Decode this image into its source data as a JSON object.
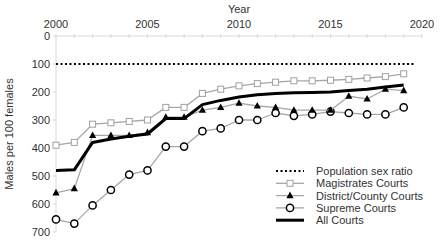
{
  "chart_data": {
    "type": "line",
    "title": "",
    "xlabel": "Year",
    "ylabel": "Males per 100 females",
    "xlim": [
      2000,
      2020
    ],
    "ylim": [
      0,
      700
    ],
    "y_inverted": true,
    "x_axis_position": "top",
    "x_ticks": [
      "2000",
      "2005",
      "2010",
      "2015",
      "2020"
    ],
    "y_ticks": [
      "0",
      "100",
      "200",
      "300",
      "400",
      "500",
      "600",
      "700"
    ],
    "grid": false,
    "legend_position": "lower right",
    "x": [
      2000,
      2001,
      2002,
      2003,
      2004,
      2005,
      2006,
      2007,
      2008,
      2009,
      2010,
      2011,
      2012,
      2013,
      2014,
      2015,
      2016,
      2017,
      2018,
      2019
    ],
    "series": [
      {
        "name": "Population sex ratio",
        "style": "dotted",
        "color": "#000000",
        "values": [
          100,
          100,
          100,
          100,
          100,
          100,
          100,
          100,
          100,
          100,
          100,
          100,
          100,
          100,
          100,
          100,
          100,
          100,
          100,
          100
        ]
      },
      {
        "name": "Magistrates Courts",
        "style": "line-open-square",
        "color": "#a6a6a6",
        "values": [
          390,
          380,
          315,
          310,
          305,
          300,
          255,
          255,
          205,
          190,
          178,
          170,
          165,
          160,
          160,
          158,
          155,
          150,
          145,
          135
        ]
      },
      {
        "name": "District/County Courts",
        "style": "line-filled-triangle",
        "color": "#a6a6a6",
        "values": [
          560,
          545,
          355,
          355,
          355,
          345,
          290,
          290,
          265,
          255,
          240,
          250,
          255,
          265,
          265,
          265,
          215,
          225,
          190,
          195
        ]
      },
      {
        "name": "Supreme Courts",
        "style": "line-open-circle",
        "color": "#a6a6a6",
        "values": [
          655,
          670,
          605,
          550,
          495,
          480,
          395,
          395,
          340,
          330,
          300,
          300,
          275,
          285,
          280,
          270,
          275,
          280,
          280,
          255
        ]
      },
      {
        "name": "All Courts",
        "style": "thick-line",
        "color": "#000000",
        "values": [
          480,
          478,
          380,
          368,
          358,
          350,
          295,
          295,
          245,
          230,
          218,
          210,
          205,
          203,
          202,
          200,
          195,
          190,
          182,
          175
        ]
      }
    ]
  }
}
